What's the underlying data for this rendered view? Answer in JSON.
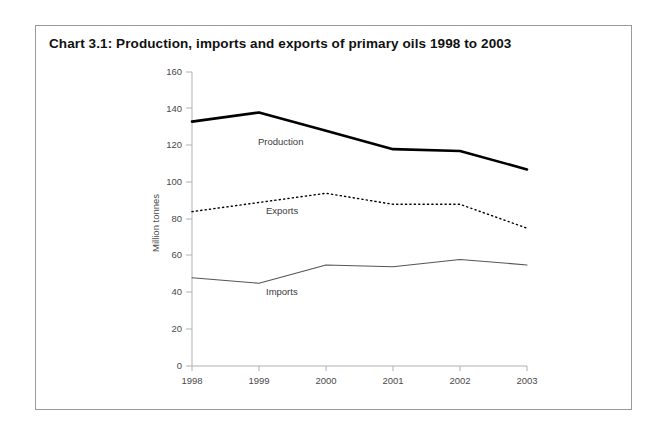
{
  "figure": {
    "title": "Chart 3.1:  Production, imports and exports of primary oils 1998 to 2003",
    "border_color": "#9a9a9a",
    "background": "#ffffff"
  },
  "axis": {
    "y_title": "Million tonnes",
    "y_ticks": [
      "0",
      "20",
      "40",
      "60",
      "80",
      "100",
      "120",
      "140",
      "160"
    ],
    "x_ticks": [
      "1998",
      "1999",
      "2000",
      "2001",
      "2002",
      "2003"
    ]
  },
  "series_labels": {
    "production": "Production",
    "exports": "Exports",
    "imports": "Imports"
  },
  "chart_data": {
    "type": "line",
    "title": "Chart 3.1:  Production, imports and exports of primary oils 1998 to 2003",
    "xlabel": "",
    "ylabel": "Million tonnes",
    "categories": [
      "1998",
      "1999",
      "2000",
      "2001",
      "2002",
      "2003"
    ],
    "x": [
      1998,
      1999,
      2000,
      2001,
      2002,
      2003
    ],
    "ylim": [
      0,
      160
    ],
    "yticks": [
      0,
      20,
      40,
      60,
      80,
      100,
      120,
      140,
      160
    ],
    "grid": false,
    "legend": "inline-labels",
    "series": [
      {
        "name": "Production",
        "values": [
          133,
          138,
          128,
          118,
          117,
          107
        ],
        "color": "#000000",
        "linestyle": "solid",
        "linewidth": 2.6
      },
      {
        "name": "Exports",
        "values": [
          84,
          89,
          94,
          88,
          88,
          75
        ],
        "color": "#000000",
        "linestyle": "dotted",
        "linewidth": 1.4
      },
      {
        "name": "Imports",
        "values": [
          48,
          45,
          55,
          54,
          58,
          55
        ],
        "color": "#555555",
        "linestyle": "solid",
        "linewidth": 1.1
      }
    ]
  }
}
